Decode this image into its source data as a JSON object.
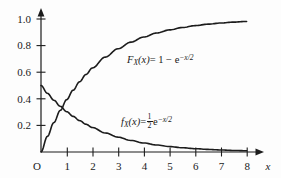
{
  "figure": {
    "background_color": "#fdfdfd",
    "curve_color": "#1c1c1c",
    "axis_color": "#1c1c1c"
  },
  "axes": {
    "origin_label": "O",
    "x_axis_name": "x",
    "x_ticks": [
      "1",
      "2",
      "3",
      "4",
      "5",
      "6",
      "7",
      "8"
    ],
    "y_ticks": [
      "0.2",
      "0.4",
      "0.6",
      "0.8",
      "1.0"
    ]
  },
  "annotations": {
    "cdf": {
      "func": "F",
      "subscript": "X",
      "arg": "(x)",
      "equals": "= 1 − e",
      "exponent": "−x/2"
    },
    "pdf": {
      "func": "f",
      "subscript": "X",
      "arg": "(x)",
      "equals": "=",
      "frac_num": "1",
      "frac_den": "2",
      "base": "e",
      "exponent": "−x/2"
    }
  },
  "chart_data": {
    "type": "line",
    "title": "",
    "xlabel": "x",
    "ylabel": "",
    "xlim": [
      0,
      8.6
    ],
    "ylim": [
      0,
      1.05
    ],
    "grid": false,
    "legend": "inline-annotations",
    "xticks": [
      1,
      2,
      3,
      4,
      5,
      6,
      7,
      8
    ],
    "yticks": [
      0.2,
      0.4,
      0.6,
      0.8,
      1.0
    ],
    "x": [
      0,
      0.25,
      0.5,
      0.75,
      1,
      1.25,
      1.5,
      1.75,
      2,
      2.5,
      3,
      3.5,
      4,
      4.5,
      5,
      5.5,
      6,
      6.5,
      7,
      7.5,
      8
    ],
    "series": [
      {
        "name": "F_X(x) = 1 - e^{-x/2}",
        "formula": "1 - exp(-x/2)",
        "kind": "cdf",
        "values": [
          0,
          0.1175,
          0.2212,
          0.3127,
          0.3935,
          0.4647,
          0.5276,
          0.5831,
          0.6321,
          0.7135,
          0.7769,
          0.8262,
          0.8647,
          0.8946,
          0.9179,
          0.9361,
          0.9502,
          0.9612,
          0.9698,
          0.9765,
          0.9817
        ]
      },
      {
        "name": "f_X(x) = (1/2) e^{-x/2}",
        "formula": "0.5 * exp(-x/2)",
        "kind": "pdf",
        "values": [
          0.5,
          0.4412,
          0.3894,
          0.3436,
          0.3033,
          0.2677,
          0.2362,
          0.2085,
          0.1839,
          0.1433,
          0.1116,
          0.0869,
          0.0677,
          0.0527,
          0.041,
          0.032,
          0.0249,
          0.0194,
          0.0151,
          0.0117,
          0.0092
        ]
      }
    ],
    "annotations": [
      {
        "text": "F_X(x) = 1 - e^{-x/2}",
        "x": 3.35,
        "y": 0.69
      },
      {
        "text": "f_X(x) = (1/2) e^{-x/2}",
        "x": 3.1,
        "y": 0.215
      }
    ]
  }
}
